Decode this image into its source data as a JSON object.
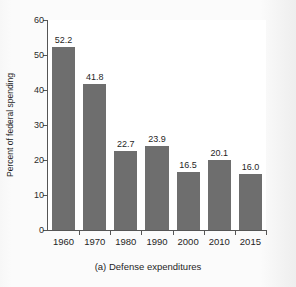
{
  "chart_data": {
    "type": "bar",
    "title": "",
    "caption": "(a) Defense expenditures",
    "xlabel": "",
    "ylabel": "Percent of federal spending",
    "categories": [
      "1960",
      "1970",
      "1980",
      "1990",
      "2000",
      "2010",
      "2015"
    ],
    "values": [
      52.2,
      41.8,
      22.7,
      23.9,
      16.5,
      20.1,
      16.0
    ],
    "value_labels": [
      "52.2",
      "41.8",
      "22.7",
      "23.9",
      "16.5",
      "20.1",
      "16.0"
    ],
    "ylim": [
      0,
      60
    ],
    "yticks": [
      0,
      10,
      20,
      30,
      40,
      50,
      60
    ],
    "ytick_labels": [
      "0",
      "10",
      "20",
      "30",
      "40",
      "50",
      "60"
    ],
    "grid": false,
    "legend": null,
    "bar_color": "#6e6e6e",
    "axis_color": "#555555",
    "plot_background": "#ffffff",
    "figure_background": "#fbfbfb"
  }
}
